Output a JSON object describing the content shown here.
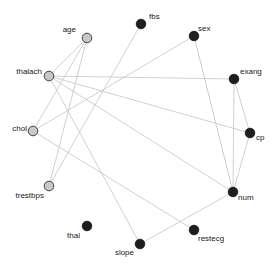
{
  "diagram": {
    "type": "network-graph",
    "colors": {
      "edge": "#c4c4c4",
      "dark_node": "#1e1e1e",
      "light_node": "#c8c8c8",
      "label": "#222222"
    },
    "nodes": [
      {
        "id": "age",
        "label": "age",
        "x": 87,
        "y": 38,
        "group": "light",
        "lx": 76,
        "ly": 32,
        "anchor": "end"
      },
      {
        "id": "fbs",
        "label": "fbs",
        "x": 141,
        "y": 24,
        "group": "dark",
        "lx": 149,
        "ly": 19,
        "anchor": "start"
      },
      {
        "id": "sex",
        "label": "sex",
        "x": 194,
        "y": 36,
        "group": "dark",
        "lx": 198,
        "ly": 31,
        "anchor": "start"
      },
      {
        "id": "thalach",
        "label": "thalach",
        "x": 49,
        "y": 76,
        "group": "light",
        "lx": 42,
        "ly": 74,
        "anchor": "end"
      },
      {
        "id": "exang",
        "label": "exang",
        "x": 234,
        "y": 79,
        "group": "dark",
        "lx": 240,
        "ly": 74,
        "anchor": "start"
      },
      {
        "id": "cp",
        "label": "cp",
        "x": 250,
        "y": 133,
        "group": "dark",
        "lx": 256,
        "ly": 140,
        "anchor": "start"
      },
      {
        "id": "chol",
        "label": "chol",
        "x": 33,
        "y": 131,
        "group": "light",
        "lx": 27,
        "ly": 131,
        "anchor": "end"
      },
      {
        "id": "num",
        "label": "num",
        "x": 233,
        "y": 192,
        "group": "dark",
        "lx": 238,
        "ly": 200,
        "anchor": "start"
      },
      {
        "id": "trestbps",
        "label": "trestbps",
        "x": 49,
        "y": 186,
        "group": "light",
        "lx": 44,
        "ly": 198,
        "anchor": "end"
      },
      {
        "id": "thai",
        "label": "thai",
        "x": 87,
        "y": 226,
        "group": "dark",
        "lx": 80,
        "ly": 238,
        "anchor": "end"
      },
      {
        "id": "restecg",
        "label": "restecg",
        "x": 194,
        "y": 230,
        "group": "dark",
        "lx": 198,
        "ly": 241,
        "anchor": "start"
      },
      {
        "id": "slope",
        "label": "slope",
        "x": 140,
        "y": 244,
        "group": "dark",
        "lx": 134,
        "ly": 255,
        "anchor": "end"
      }
    ],
    "edges": [
      [
        "age",
        "thalach"
      ],
      [
        "age",
        "chol"
      ],
      [
        "age",
        "trestbps"
      ],
      [
        "fbs",
        "trestbps"
      ],
      [
        "sex",
        "chol"
      ],
      [
        "sex",
        "num"
      ],
      [
        "thalach",
        "exang"
      ],
      [
        "thalach",
        "cp"
      ],
      [
        "thalach",
        "num"
      ],
      [
        "thalach",
        "slope"
      ],
      [
        "chol",
        "restecg"
      ],
      [
        "exang",
        "num"
      ],
      [
        "exang",
        "cp"
      ],
      [
        "cp",
        "num"
      ],
      [
        "num",
        "slope"
      ]
    ]
  }
}
